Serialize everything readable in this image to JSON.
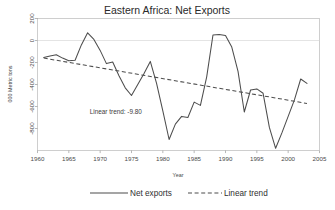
{
  "chart_data": {
    "type": "line",
    "title": "Eastern Africa: Net Exports",
    "xlabel": "Year",
    "ylabel": "000 Metric tons",
    "xlim": [
      1960,
      2005
    ],
    "ylim": [
      -1000,
      200
    ],
    "xticks": [
      1960,
      1965,
      1970,
      1975,
      1980,
      1985,
      1990,
      1995,
      2000,
      2005
    ],
    "xtick_labels": [
      "1960",
      "1965",
      "1970",
      "1975",
      "1980",
      "1985",
      "1990",
      "1995",
      "2000",
      "2005"
    ],
    "yticks": [
      200,
      0,
      -200,
      -400,
      -600,
      -800
    ],
    "ytick_labels": [
      "200",
      "0",
      "-200",
      "-400",
      "-600",
      "-800"
    ],
    "grid": false,
    "zero_line": true,
    "legend_position": "bottom",
    "annotations": [
      {
        "text": "Linear trend:  -9.80",
        "x": 1972.5,
        "y": -672
      }
    ],
    "series": [
      {
        "name": "Net exports",
        "style": "solid",
        "color": "#4d4d4d",
        "x": [
          1961,
          1962,
          1963,
          1964,
          1965,
          1966,
          1967,
          1968,
          1969,
          1970,
          1971,
          1972,
          1973,
          1974,
          1975,
          1976,
          1977,
          1978,
          1979,
          1980,
          1981,
          1982,
          1983,
          1984,
          1985,
          1986,
          1987,
          1988,
          1989,
          1990,
          1991,
          1992,
          1993,
          1994,
          1995,
          1996,
          1997,
          1998,
          1999,
          2000,
          2001,
          2002,
          2003
        ],
        "values": [
          -155,
          -140,
          -130,
          -160,
          -185,
          -180,
          -40,
          70,
          10,
          -90,
          -210,
          -195,
          -320,
          -430,
          -500,
          -400,
          -300,
          -190,
          -390,
          -640,
          -900,
          -760,
          -690,
          -700,
          -560,
          -590,
          -330,
          50,
          55,
          45,
          -60,
          -280,
          -650,
          -450,
          -440,
          -480,
          -790,
          -980,
          -840,
          -690,
          -540,
          -350,
          -390
        ]
      },
      {
        "name": "Linear trend",
        "style": "dashed",
        "color": "#4d4d4d",
        "x": [
          1961,
          2003
        ],
        "values": [
          -160,
          -572
        ]
      }
    ]
  },
  "legend": {
    "items": [
      {
        "label": "Net exports",
        "style": "solid"
      },
      {
        "label": "Linear trend",
        "style": "dashed"
      }
    ]
  }
}
